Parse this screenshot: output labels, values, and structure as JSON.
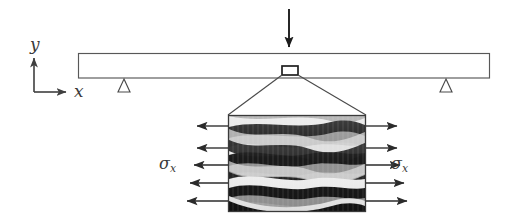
{
  "figure": {
    "background_color": "#ffffff",
    "line_color": "#4a4a4a",
    "dark_ply_color": "#141414",
    "mid_ply_color": "#8c8c8c",
    "light_ply_color": "#ebebeb"
  },
  "axes": {
    "name": "coordinate-axes",
    "origin": {
      "x": 34,
      "y": 92
    },
    "y_axis": {
      "label": "y",
      "tip": {
        "x": 34,
        "y": 54
      }
    },
    "x_axis": {
      "label": "x",
      "tip": {
        "x": 71,
        "y": 92
      }
    }
  },
  "beam": {
    "name": "beam",
    "left": 78,
    "right": 490,
    "top": 53,
    "bottom": 78
  },
  "load": {
    "name": "point-load-arrow",
    "x": 289,
    "top": 9,
    "bottom": 51,
    "direction": "down"
  },
  "supports": [
    {
      "name": "pin-support-left",
      "cx": 124,
      "top": 79,
      "half_width": 6,
      "height": 13
    },
    {
      "name": "pin-support-right",
      "cx": 446,
      "top": 79,
      "half_width": 6,
      "height": 13
    }
  ],
  "element_marker": {
    "name": "beam-element-marker",
    "left": 282,
    "top": 66,
    "width": 16,
    "height": 9
  },
  "magnifier": {
    "name": "magnification-lines",
    "from_left": {
      "x": 282,
      "y": 75
    },
    "from_right": {
      "x": 298,
      "y": 75
    },
    "to_left": {
      "x": 228,
      "y": 115
    },
    "to_right": {
      "x": 366,
      "y": 115
    }
  },
  "element_block": {
    "name": "laminate-element-block",
    "left": 228,
    "top": 115,
    "right": 366,
    "bottom": 212,
    "ply_count": 6,
    "description": "woven composite laminate with wavy dark tows"
  },
  "stress_left": {
    "name": "stress-arrows-left",
    "label": "σ",
    "subscript": "x",
    "direction": "left",
    "arrow_count": 5,
    "arrow_ys": [
      126,
      148,
      165,
      183,
      201
    ],
    "tail_x": 228,
    "tip_x": 192
  },
  "stress_right": {
    "name": "stress-arrows-right",
    "label": "σ",
    "subscript": "x",
    "direction": "right",
    "arrow_count": 5,
    "arrow_ys": [
      126,
      148,
      165,
      183,
      201
    ],
    "tail_x": 366,
    "tip_x": 402
  }
}
